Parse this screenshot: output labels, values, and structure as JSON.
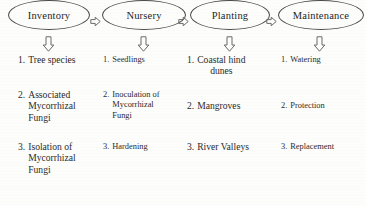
{
  "diagram": {
    "type": "horizontal-process-flow",
    "stroke_color": "#4a4a4a",
    "text_color": "#1f1f1f",
    "background_color": "#fdfdfb",
    "connector_icon": "block-arrow-right-icon",
    "branch_icon": "block-arrow-down-icon",
    "stages": [
      {
        "id": "inventory",
        "label": "Inventory",
        "items": [
          {
            "num": "1.",
            "line1": "Tree species",
            "line2": "",
            "line3": ""
          },
          {
            "num": "2.",
            "line1": "Associated",
            "line2": "Mycorrhizal",
            "line3": "Fungi"
          },
          {
            "num": "3.",
            "line1": "Isolation of",
            "line2": "Mycorrhizal",
            "line3": "Fungi"
          }
        ]
      },
      {
        "id": "nursery",
        "label": "Nursery",
        "items": [
          {
            "num": "1.",
            "line1": "Seedlings",
            "line2": "",
            "line3": ""
          },
          {
            "num": "2.",
            "line1": "Inoculation of",
            "line2": "Mycorrhizal",
            "line3": "Fungi"
          },
          {
            "num": "3.",
            "line1": "Hardening",
            "line2": "",
            "line3": ""
          }
        ]
      },
      {
        "id": "planting",
        "label": "Planting",
        "items": [
          {
            "num": "1.",
            "line1": "Coastal hind",
            "line2": "dunes",
            "line3": ""
          },
          {
            "num": "2.",
            "line1": "Mangroves",
            "line2": "",
            "line3": ""
          },
          {
            "num": "3.",
            "line1": "River Valleys",
            "line2": "",
            "line3": ""
          }
        ]
      },
      {
        "id": "maintenance",
        "label": "Maintenance",
        "items": [
          {
            "num": "1.",
            "line1": "Watering",
            "line2": "",
            "line3": ""
          },
          {
            "num": "2.",
            "line1": "Protection",
            "line2": "",
            "line3": ""
          },
          {
            "num": "3.",
            "line1": "Replacement",
            "line2": "",
            "line3": ""
          }
        ]
      }
    ]
  }
}
